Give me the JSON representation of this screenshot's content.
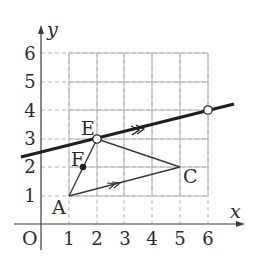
{
  "diagram": {
    "type": "coordinate-geometry",
    "axes": {
      "x_label": "x",
      "y_label": "y",
      "origin_label": "O",
      "x_ticks": [
        "1",
        "2",
        "3",
        "4",
        "5",
        "6"
      ],
      "y_ticks": [
        "1",
        "2",
        "3",
        "4",
        "5",
        "6"
      ],
      "x_range": [
        0,
        6
      ],
      "y_range": [
        0,
        6
      ]
    },
    "points": [
      {
        "label": "A",
        "x": 1,
        "y": 1,
        "marker": "none"
      },
      {
        "label": "E",
        "x": 2,
        "y": 3,
        "marker": "open-circle"
      },
      {
        "label": "F",
        "x": 1.5,
        "y": 2,
        "marker": "filled-dot"
      },
      {
        "label": "C",
        "x": 5,
        "y": 2,
        "marker": "none"
      },
      {
        "label": "",
        "x": 6,
        "y": 4,
        "marker": "open-circle"
      }
    ],
    "segments": [
      {
        "from": "A",
        "to": "E"
      },
      {
        "from": "E",
        "to": "C"
      },
      {
        "from": "A",
        "to": "C",
        "parallel_mark": "double-arrow"
      }
    ],
    "lines": [
      {
        "through": [
          "E",
          "(6,4)"
        ],
        "style": "thick",
        "parallel_to": "AC",
        "parallel_mark": "double-arrow"
      }
    ],
    "colors": {
      "stroke": "#2a2a2a",
      "grid": "#b0b0b0",
      "background": "#ffffff"
    }
  }
}
